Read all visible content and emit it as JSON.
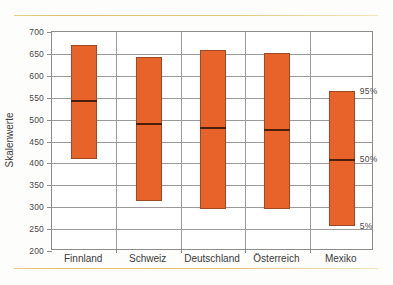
{
  "chart_data": {
    "type": "bar",
    "title": "",
    "xlabel": "",
    "ylabel": "Skalenwerte",
    "ylim": [
      200,
      700
    ],
    "ytick_step": 50,
    "yticks": [
      700,
      650,
      600,
      550,
      500,
      450,
      400,
      350,
      300,
      250,
      200
    ],
    "grid": true,
    "legend_position": "inside-right",
    "categories": [
      "Finnland",
      "Schweiz",
      "Deutschland",
      "Österreich",
      "Mexiko"
    ],
    "series": [
      {
        "name": "95%",
        "values": [
          670,
          643,
          658,
          653,
          565
        ]
      },
      {
        "name": "50%",
        "values": [
          545,
          492,
          484,
          478,
          410
        ]
      },
      {
        "name": "5%",
        "values": [
          410,
          315,
          296,
          295,
          257
        ]
      }
    ],
    "bars": [
      {
        "category": "Finnland",
        "p95": 670,
        "p50": 545,
        "p5": 410
      },
      {
        "category": "Schweiz",
        "p95": 643,
        "p50": 492,
        "p5": 315
      },
      {
        "category": "Deutschland",
        "p95": 658,
        "p50": 484,
        "p5": 296
      },
      {
        "category": "Österreich",
        "p95": 653,
        "p50": 478,
        "p5": 295
      },
      {
        "category": "Mexiko",
        "p95": 565,
        "p50": 410,
        "p5": 257
      }
    ],
    "annotations": [
      {
        "text": "95%",
        "value": 565
      },
      {
        "text": "50%",
        "value": 410
      },
      {
        "text": "5%",
        "value": 257
      }
    ],
    "colors": {
      "bar_fill": "#e8632a",
      "bar_border": "#9c4a23",
      "median_line": "#4a1f0c",
      "gridline": "#9a9a9a",
      "axis": "#8c8c8c",
      "rule": "#dfbf72",
      "background": "#fdfdfc",
      "text": "#3b3b3b"
    }
  }
}
